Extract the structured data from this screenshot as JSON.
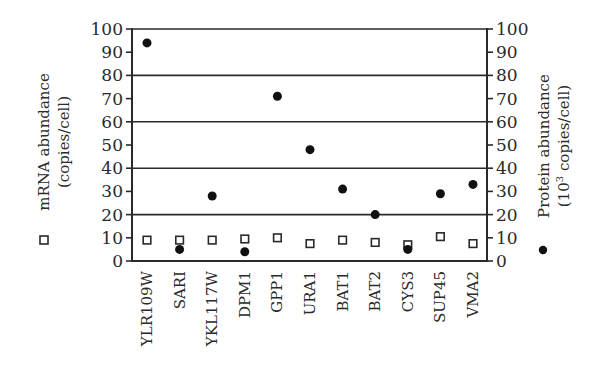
{
  "chart_data": {
    "type": "scatter",
    "title": "",
    "categories": [
      "YLR109W",
      "SARI",
      "YKL117W",
      "DPM1",
      "GPP1",
      "URA1",
      "BAT1",
      "BAT2",
      "CYS3",
      "SUP45",
      "VMA2"
    ],
    "series": [
      {
        "name": "mRNA abundance",
        "marker": "open-square",
        "axis": "left",
        "values": [
          9,
          9,
          9,
          9.5,
          10,
          7.5,
          9,
          8,
          7,
          10.5,
          7.5
        ]
      },
      {
        "name": "Protein abundance",
        "marker": "filled-circle",
        "axis": "right",
        "values": [
          94,
          5,
          28,
          4,
          71,
          48,
          31,
          20,
          5,
          29,
          33
        ]
      }
    ],
    "left_axis": {
      "label_line1": "mRNA abundance",
      "label_line2": "(copies/cell)",
      "legend_marker": "open-square",
      "ylim": [
        0,
        100
      ],
      "ticks": [
        "0",
        "10",
        "20",
        "30",
        "40",
        "50",
        "60",
        "70",
        "80",
        "90",
        "100"
      ]
    },
    "right_axis": {
      "label_line1": "Protein abundance",
      "label_line2_prefix": "(10",
      "label_line2_sup": "3",
      "label_line2_suffix": " copies/cell)",
      "legend_marker": "filled-circle",
      "ylim": [
        0,
        100
      ],
      "ticks": [
        "0",
        "10",
        "20",
        "30",
        "40",
        "50",
        "60",
        "70",
        "80",
        "90",
        "100"
      ]
    },
    "gridlines": [
      20,
      40,
      60,
      80,
      100
    ],
    "grid": true
  }
}
